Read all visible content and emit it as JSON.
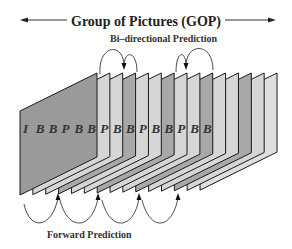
{
  "title": "Group of Pictures  (GOP)",
  "labels": {
    "bidirectional": "Bi–directional  Prediction",
    "forward": "Forward  Prediction"
  },
  "frames": [
    "I",
    "B",
    "B",
    "P",
    "B",
    "B",
    "P",
    "B",
    "B",
    "P",
    "B",
    "B",
    "P",
    "B",
    "B"
  ],
  "colors": {
    "i_frame": "#9a9a9a",
    "p_frame": "#a8a8a8",
    "b_frame": "#d6d6d6",
    "last_frame": "#dedede",
    "outline": "#1a1a1a",
    "arrow": "#333333"
  }
}
